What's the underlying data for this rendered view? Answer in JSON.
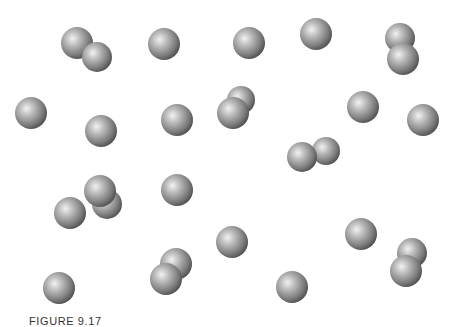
{
  "figure": {
    "caption": "FIGURE 9.17",
    "particle_color": {
      "highlight": "#f2f2f2",
      "mid": "#9a9a9a",
      "edge": "#4a4a4a"
    },
    "particles": [
      {
        "kind": "diatomic",
        "id": "molecule-1"
      },
      {
        "kind": "atom",
        "id": "atom-1"
      },
      {
        "kind": "atom",
        "id": "atom-2"
      },
      {
        "kind": "atom",
        "id": "atom-3"
      },
      {
        "kind": "diatomic",
        "id": "molecule-2"
      },
      {
        "kind": "atom",
        "id": "atom-4"
      },
      {
        "kind": "atom",
        "id": "atom-5"
      },
      {
        "kind": "atom",
        "id": "atom-6"
      },
      {
        "kind": "diatomic",
        "id": "molecule-3"
      },
      {
        "kind": "atom",
        "id": "atom-7"
      },
      {
        "kind": "atom",
        "id": "atom-8"
      },
      {
        "kind": "diatomic",
        "id": "molecule-4"
      },
      {
        "kind": "atom",
        "id": "atom-9"
      },
      {
        "kind": "diatomic",
        "id": "molecule-5"
      },
      {
        "kind": "atom",
        "id": "atom-10"
      },
      {
        "kind": "atom",
        "id": "atom-11"
      },
      {
        "kind": "diatomic",
        "id": "molecule-6"
      },
      {
        "kind": "atom",
        "id": "atom-12"
      },
      {
        "kind": "atom",
        "id": "atom-13"
      },
      {
        "kind": "atom",
        "id": "atom-14"
      },
      {
        "kind": "diatomic",
        "id": "molecule-7"
      }
    ]
  }
}
